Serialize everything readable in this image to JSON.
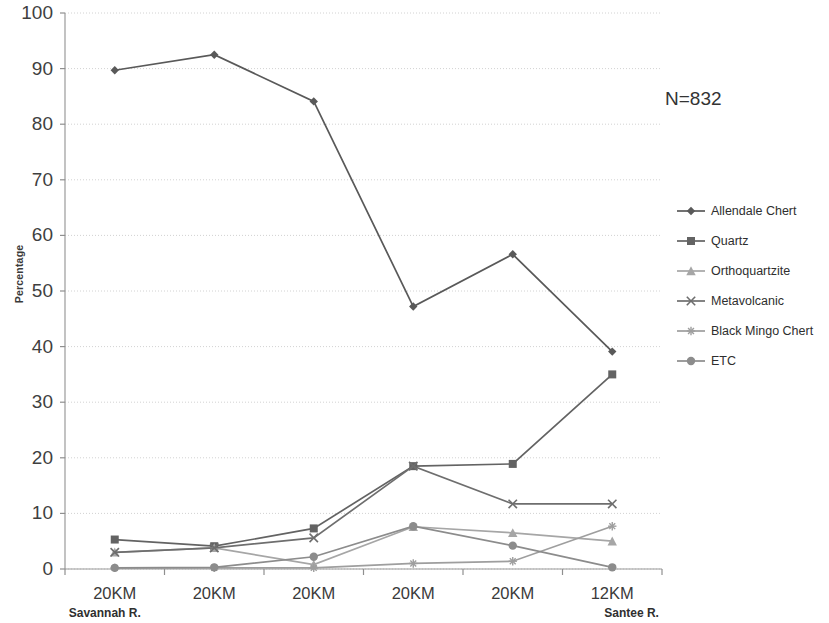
{
  "chart_data": {
    "type": "line",
    "title": "",
    "subtitle": "",
    "xlabel": "",
    "ylabel": "Percentage",
    "ylim": [
      0,
      100
    ],
    "ytick_step": 10,
    "ytick_labels": [
      "100",
      "90",
      "80",
      "70",
      "60",
      "50",
      "40",
      "30",
      "20",
      "10",
      "0"
    ],
    "grid": true,
    "legend_position": "right",
    "annotation": "N=832",
    "categories": [
      "20KM",
      "20KM",
      "20KM",
      "20KM",
      "20KM",
      "12KM"
    ],
    "category_sublabels": [
      "Savannah R.",
      "",
      "",
      "",
      "",
      "Santee R."
    ],
    "series": [
      {
        "name": "Allendale Chert",
        "marker": "diamond",
        "color": "#595959",
        "values": [
          89.7,
          92.5,
          84.1,
          47.2,
          56.6,
          39.1
        ]
      },
      {
        "name": "Quartz",
        "marker": "square",
        "color": "#636363",
        "values": [
          5.3,
          4.1,
          7.3,
          18.5,
          18.9,
          35.0
        ]
      },
      {
        "name": "Orthoquartzite",
        "marker": "triangle",
        "color": "#a6a6a6",
        "values": [
          3.0,
          3.8,
          0.8,
          7.6,
          6.5,
          5.0
        ]
      },
      {
        "name": "Metavolcanic",
        "marker": "cross",
        "color": "#6e6e6e",
        "values": [
          3.0,
          3.8,
          5.6,
          18.5,
          11.7,
          11.7
        ]
      },
      {
        "name": "Black Mingo Chert",
        "marker": "star",
        "color": "#9e9e9e",
        "values": [
          0.2,
          0.2,
          0.2,
          1.0,
          1.4,
          7.7
        ]
      },
      {
        "name": "ETC",
        "marker": "circle",
        "color": "#8c8c8c",
        "values": [
          0.2,
          0.3,
          2.2,
          7.7,
          4.2,
          0.3
        ]
      }
    ]
  },
  "legend": {
    "items": [
      {
        "label": "Allendale Chert"
      },
      {
        "label": "Quartz"
      },
      {
        "label": "Orthoquartzite"
      },
      {
        "label": "Metavolcanic"
      },
      {
        "label": "Black Mingo Chert"
      },
      {
        "label": "ETC"
      }
    ]
  }
}
